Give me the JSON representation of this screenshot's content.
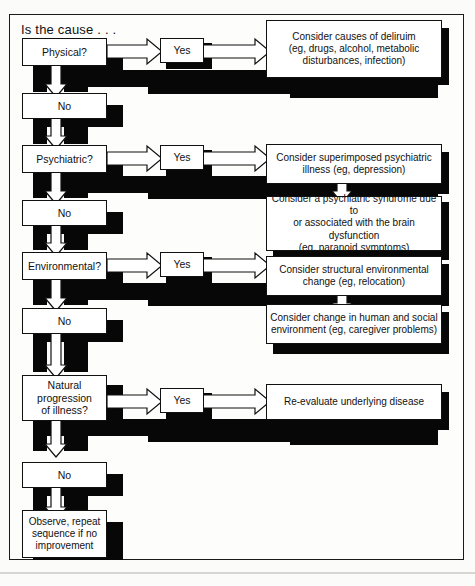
{
  "figure": {
    "title": "Is the cause . . .",
    "type": "decision-flowchart",
    "frame_color": "#111111",
    "box_fill": "#ffffff",
    "shadow_color": "#070707"
  },
  "decisions": [
    {
      "id": "physical",
      "label": "Physical?"
    },
    {
      "id": "psychiatric",
      "label": "Psychiatric?"
    },
    {
      "id": "environmental",
      "label": "Environmental?"
    },
    {
      "id": "natural",
      "label": "Natural progression of illness?",
      "lines": [
        "Natural",
        "progression",
        "of illness?"
      ]
    }
  ],
  "no_labels": [
    {
      "id": "no-1",
      "label": "No"
    },
    {
      "id": "no-2",
      "label": "No"
    },
    {
      "id": "no-3",
      "label": "No"
    },
    {
      "id": "no-4",
      "label": "No"
    }
  ],
  "yes_labels": [
    {
      "id": "yes-1",
      "label": "Yes"
    },
    {
      "id": "yes-2",
      "label": "Yes"
    },
    {
      "id": "yes-3",
      "label": "Yes"
    },
    {
      "id": "yes-4",
      "label": "Yes"
    }
  ],
  "outcomes": [
    {
      "id": "outcome-delirium",
      "branch": "physical",
      "lines": [
        "Consider causes of deliruim",
        "(eg, drugs, alcohol, metabolic",
        "disturbances, infection)"
      ]
    },
    {
      "id": "outcome-superimposed-psychiatric",
      "branch": "psychiatric",
      "lines": [
        "Consider superimposed psychiatric",
        "illness (eg, depression)"
      ]
    },
    {
      "id": "outcome-psychiatric-syndrome",
      "branch": "psychiatric",
      "lines": [
        "Consider a psychiatric syndrome due to",
        "or associated with the brain dysfunction",
        "(eg, paranoid symptoms)"
      ]
    },
    {
      "id": "outcome-structural-environmental",
      "branch": "environmental",
      "lines": [
        "Consider structural environmental",
        "change (eg, relocation)"
      ]
    },
    {
      "id": "outcome-human-social",
      "branch": "environmental",
      "lines": [
        "Consider change in human and social",
        "environment (eg, caregiver problems)"
      ]
    },
    {
      "id": "outcome-reevaluate",
      "branch": "natural",
      "lines": [
        "Re-evaluate underlying disease"
      ]
    }
  ],
  "terminal": {
    "id": "observe-repeat",
    "lines": [
      "Observe, repeat",
      "sequence if no",
      "improvement"
    ]
  }
}
